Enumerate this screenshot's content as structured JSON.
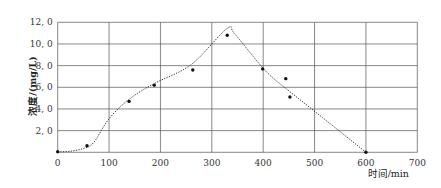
{
  "chart_data": {
    "type": "scatter",
    "title": "",
    "xlabel": "时间/min",
    "ylabel": "浓度/(mg/L)",
    "xlim": [
      0,
      700
    ],
    "ylim": [
      0,
      12
    ],
    "grid": true,
    "legend": null,
    "x_ticks": [
      "0",
      "100",
      "200",
      "300",
      "400",
      "500",
      "600",
      "700"
    ],
    "y_ticks": [
      "2.0",
      "4.0",
      "6.0",
      "8.0",
      "10.0",
      "12.0"
    ],
    "series": [
      {
        "name": "measured",
        "style": "points",
        "x": [
          0,
          57,
          139,
          188,
          263,
          330,
          399,
          444,
          452,
          600
        ],
        "y": [
          0.05,
          0.6,
          4.7,
          6.2,
          7.6,
          10.8,
          7.7,
          6.8,
          5.1,
          0.0
        ]
      },
      {
        "name": "fitted curve",
        "style": "dotted-line",
        "x": [
          0,
          25,
          50,
          70,
          100,
          139,
          188,
          260,
          329,
          345,
          405,
          452,
          505,
          600
        ],
        "y": [
          0.05,
          0.1,
          0.35,
          0.9,
          3.1,
          4.9,
          6.35,
          8.1,
          11.4,
          10.9,
          7.5,
          5.6,
          3.6,
          0.0
        ]
      }
    ]
  }
}
